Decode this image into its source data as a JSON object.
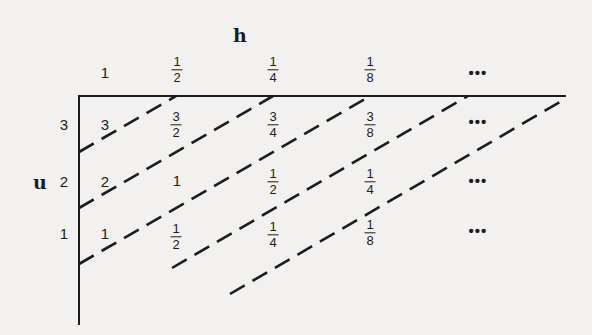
{
  "diagram": {
    "axes": {
      "h_label": "h",
      "u_label": "u"
    },
    "column_headers": [
      {
        "type": "int",
        "value": "1"
      },
      {
        "type": "frac",
        "num": "1",
        "den": "2"
      },
      {
        "type": "frac",
        "num": "1",
        "den": "4"
      },
      {
        "type": "frac",
        "num": "1",
        "den": "8"
      },
      {
        "type": "ellipsis",
        "value": "•••"
      }
    ],
    "row_headers": [
      "3",
      "2",
      "1"
    ],
    "cells": {
      "row3": [
        {
          "type": "int",
          "value": "3"
        },
        {
          "type": "frac",
          "num": "3",
          "den": "2"
        },
        {
          "type": "frac",
          "num": "3",
          "den": "4"
        },
        {
          "type": "frac",
          "num": "3",
          "den": "8"
        },
        {
          "type": "ellipsis",
          "value": "•••"
        }
      ],
      "row2": [
        {
          "type": "int",
          "value": "2"
        },
        {
          "type": "int",
          "value": "1"
        },
        {
          "type": "frac",
          "num": "1",
          "den": "2"
        },
        {
          "type": "frac",
          "num": "1",
          "den": "4"
        },
        {
          "type": "ellipsis",
          "value": "•••"
        }
      ],
      "row1": [
        {
          "type": "int",
          "value": "1"
        },
        {
          "type": "frac",
          "num": "1",
          "den": "2"
        },
        {
          "type": "frac",
          "num": "1",
          "den": "4"
        },
        {
          "type": "frac",
          "num": "1",
          "den": "8"
        },
        {
          "type": "ellipsis",
          "value": "•••"
        }
      ]
    },
    "dashed_lines": [
      {
        "x1": 79,
        "y1": 152,
        "x2": 176,
        "y2": 96
      },
      {
        "x1": 79,
        "y1": 208,
        "x2": 273,
        "y2": 96
      },
      {
        "x1": 79,
        "y1": 264,
        "x2": 370,
        "y2": 96
      },
      {
        "x1": 172,
        "y1": 268,
        "x2": 468,
        "y2": 96
      },
      {
        "x1": 230,
        "y1": 294,
        "x2": 565,
        "y2": 99
      }
    ],
    "colors": {
      "ink": "#1c1c1c",
      "paper": "#f2f1ef"
    }
  }
}
